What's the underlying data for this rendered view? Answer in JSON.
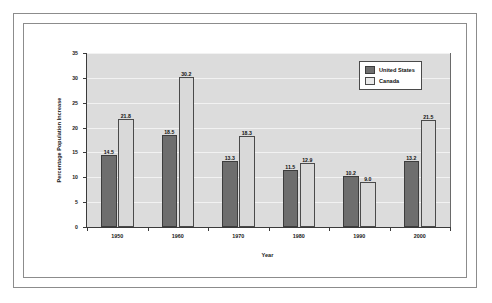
{
  "chart_data": {
    "type": "bar",
    "title": "",
    "xlabel": "Year",
    "ylabel": "Percentage Population Increase",
    "categories": [
      "1950",
      "1960",
      "1970",
      "1980",
      "1990",
      "2000"
    ],
    "series": [
      {
        "name": "United States",
        "color": "#6e6e6e",
        "values": [
          14.5,
          18.5,
          13.3,
          11.5,
          10.2,
          13.2
        ],
        "labels": [
          "14.5",
          "18.5",
          "13.3",
          "11.5",
          "10.2",
          "13.2"
        ]
      },
      {
        "name": "Canada",
        "color": "#d9d9d9",
        "values": [
          21.8,
          30.2,
          18.3,
          12.9,
          9.0,
          21.5
        ],
        "labels": [
          "21.8",
          "30.2",
          "18.3",
          "12.9",
          "9.0",
          "21.5"
        ]
      }
    ],
    "ylim": [
      0,
      35
    ],
    "yticks": [
      0,
      5,
      10,
      15,
      20,
      25,
      30,
      35
    ],
    "ytick_labels": [
      "0",
      "5",
      "10",
      "15",
      "20",
      "25",
      "30",
      "35"
    ],
    "grid": true,
    "legend_position": "top-right",
    "plot_background": "#dcdcdc"
  },
  "legend": {
    "entries": [
      {
        "label": "United States"
      },
      {
        "label": "Canada"
      }
    ]
  },
  "axes": {
    "x_title": "Year",
    "y_title": "Percentage Population Increase"
  }
}
